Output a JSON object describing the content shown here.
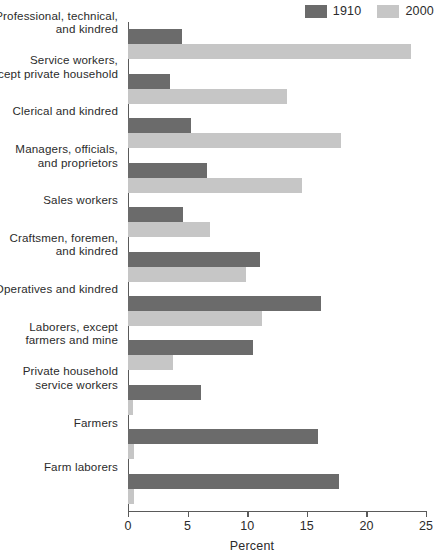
{
  "legend": {
    "entries": [
      {
        "label": "1910",
        "color": "#6b6b6b",
        "icon": "legend-swatch-icon"
      },
      {
        "label": "2000",
        "color": "#c6c6c6",
        "icon": "legend-swatch-icon"
      }
    ]
  },
  "axis": {
    "xlabel": "Percent",
    "ticks": [
      "0",
      "5",
      "10",
      "15",
      "20",
      "25"
    ]
  },
  "chart_data": {
    "type": "bar",
    "orientation": "horizontal",
    "title": "",
    "xlabel": "Percent",
    "ylabel": "",
    "xlim": [
      0,
      25
    ],
    "xticks": [
      0,
      5,
      10,
      15,
      20,
      25
    ],
    "grid": false,
    "legend_position": "top-right",
    "categories": [
      "Professional, technical,\nand kindred",
      "Service workers,\nexcept private household",
      "Clerical and kindred",
      "Managers, officials,\nand proprietors",
      "Sales workers",
      "Craftsmen, foremen,\nand kindred",
      "Operatives and kindred",
      "Laborers, except\nfarmers and mine",
      "Private household\nservice workers",
      "Farmers",
      "Farm laborers"
    ],
    "series": [
      {
        "name": "1910",
        "color": "#6b6b6b",
        "values": [
          4.5,
          3.5,
          5.3,
          6.6,
          4.6,
          11.1,
          16.2,
          10.5,
          6.1,
          15.9,
          17.7
        ]
      },
      {
        "name": "2000",
        "color": "#c6c6c6",
        "values": [
          23.7,
          13.3,
          17.9,
          14.6,
          6.9,
          9.9,
          11.2,
          3.8,
          0.4,
          0.5,
          0.5
        ]
      }
    ]
  }
}
